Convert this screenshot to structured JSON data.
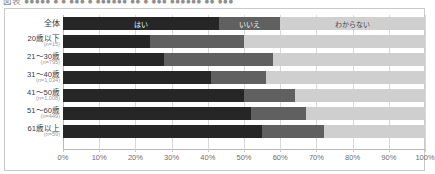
{
  "caption": {
    "text": "図表  ●●●●●  ● ● ●●● ● ●●●●●●  ●● ● ●●●  ●●●●●●  ●● ●●●"
  },
  "chart_data": {
    "type": "bar",
    "orientation": "horizontal",
    "stacked": true,
    "normalized": true,
    "title": "",
    "xlabel": "",
    "ylabel": "",
    "xlim": [
      0,
      100
    ],
    "grid": true,
    "legend_position": "in-bar-top-row",
    "categories": [
      "全体",
      "20歳以下",
      "21～30歳",
      "31～40歳",
      "41～50歳",
      "51～60歳",
      "61歳以上"
    ],
    "category_counts": [
      "",
      "(n=15)",
      "(n=795)",
      "(n=1,034)",
      "(n=1,008)",
      "(n=449)",
      "(n=59)"
    ],
    "series": [
      {
        "name": "はい",
        "color": "#262626",
        "values": [
          43.0,
          24.0,
          28.0,
          41.0,
          50.0,
          52.0,
          55.0
        ]
      },
      {
        "name": "いいえ",
        "color": "#606060",
        "values": [
          17.0,
          26.0,
          30.0,
          15.0,
          14.0,
          15.0,
          17.0
        ]
      },
      {
        "name": "わからない",
        "color": "#cfcfcf",
        "values": [
          40.0,
          50.0,
          42.0,
          44.0,
          36.0,
          33.0,
          28.0
        ]
      }
    ],
    "tick_labels": [
      "0%",
      "10%",
      "20%",
      "30%",
      "40%",
      "50%",
      "60%",
      "70%",
      "80%",
      "90%",
      "100%"
    ],
    "tick_values": [
      0,
      10,
      20,
      30,
      40,
      50,
      60,
      70,
      80,
      90,
      100
    ]
  }
}
